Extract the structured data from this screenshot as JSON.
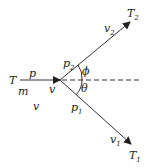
{
  "diagram": {
    "title": "",
    "incoming": {
      "T": "T",
      "p": "p",
      "m": "m",
      "v_lower": "v",
      "v_vertex": "v"
    },
    "upper": {
      "p": "p",
      "p_sub": "2",
      "v": "v",
      "v_sub": "2",
      "T": "T",
      "T_sub": "2"
    },
    "lower": {
      "p": "p",
      "p_sub": "1",
      "v": "v",
      "v_sub": "1",
      "T": "T",
      "T_sub": "1"
    },
    "angles": {
      "phi": "ϕ",
      "theta": "θ"
    },
    "colors": {
      "line": "#333333"
    }
  }
}
